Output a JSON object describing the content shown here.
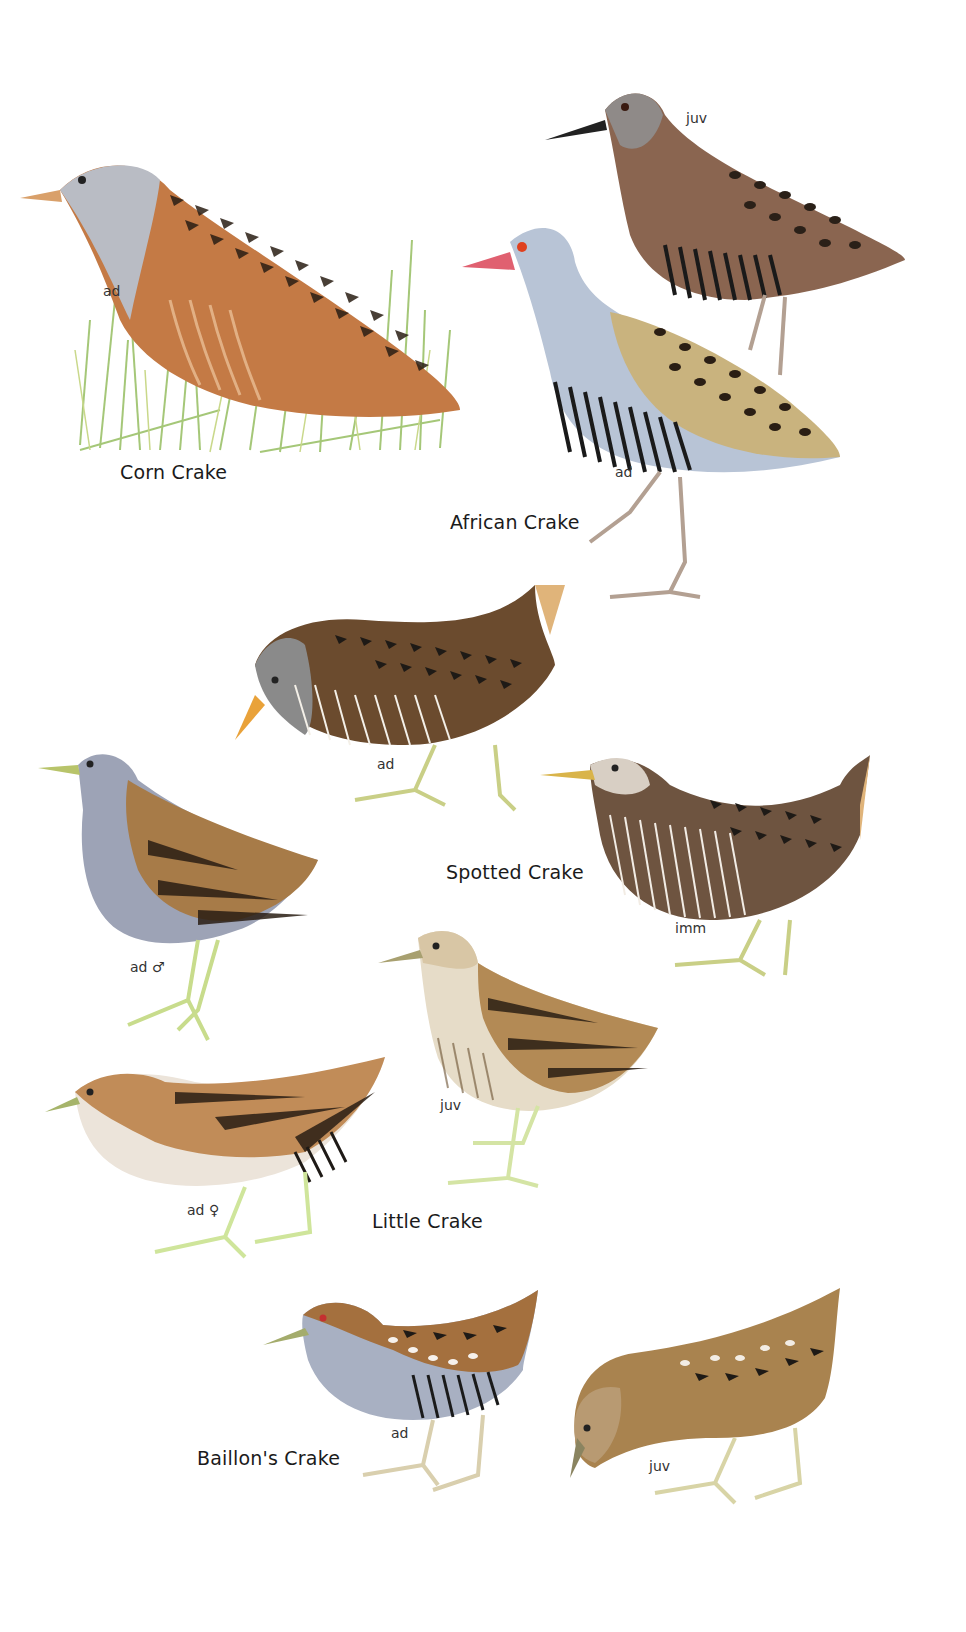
{
  "plate": {
    "background": "#ffffff",
    "species": [
      {
        "name": "Corn Crake",
        "figures": [
          {
            "label": "ad",
            "colors": {
              "body": "#c47a45",
              "head": "#b9bcc4",
              "markings": "#2a1e14",
              "bill": "#d9a06a"
            }
          }
        ],
        "habitat": "grass"
      },
      {
        "name": "African Crake",
        "figures": [
          {
            "label": "juv",
            "colors": {
              "body": "#8a6550",
              "head": "#8f8a88",
              "markings": "#2a2018",
              "bars": "#1a1a1a",
              "bill": "#222222"
            }
          },
          {
            "label": "ad",
            "colors": {
              "body": "#c9b37e",
              "head": "#b8c4d6",
              "markings": "#2a1e14",
              "bars": "#1a1a1a",
              "eye": "#e0401e",
              "bill": "#e06070"
            }
          }
        ]
      },
      {
        "name": "Spotted Crake",
        "figures": [
          {
            "label": "ad",
            "colors": {
              "body": "#6b4b2e",
              "head": "#8a8a8a",
              "markings": "#1e1a16",
              "bill": "#e9a23a",
              "legs": "#c9cf86"
            }
          },
          {
            "label": "imm",
            "colors": {
              "body": "#6e5440",
              "head": "#d8cfc4",
              "markings": "#1e1a16",
              "bill": "#d9b44a",
              "legs": "#c9cf86"
            }
          }
        ]
      },
      {
        "name": "Little Crake",
        "figures": [
          {
            "label": "ad ♂",
            "colors": {
              "body": "#a77b48",
              "head": "#9da3b6",
              "underparts": "#a7abc2",
              "markings": "#2a1e14",
              "bill": "#b8c46a",
              "legs": "#c8dc8c"
            }
          },
          {
            "label": "juv",
            "colors": {
              "body": "#b38a55",
              "head": "#d8c6a5",
              "underparts": "#e6dcc8",
              "markings": "#2a1e14",
              "bill": "#a8a070",
              "legs": "#d4e4a4"
            }
          },
          {
            "label": "ad ♀",
            "colors": {
              "body": "#c18c58",
              "head": "#c99b6a",
              "underparts": "#ece4da",
              "markings": "#2a1e14",
              "bill": "#a6b46a",
              "legs": "#cfe59b"
            }
          }
        ]
      },
      {
        "name": "Baillon's Crake",
        "figures": [
          {
            "label": "ad",
            "colors": {
              "body": "#a4703e",
              "head": "#9aa4b8",
              "underparts": "#a8b0c2",
              "markings": "#1e1a16",
              "eye": "#c43030",
              "bill": "#a4ac6c",
              "legs": "#d9cfae"
            }
          },
          {
            "label": "juv",
            "colors": {
              "body": "#a9834f",
              "head": "#b89a72",
              "markings": "#1e1a16",
              "bill": "#8a8460",
              "legs": "#d8d4a6"
            }
          }
        ]
      }
    ]
  }
}
